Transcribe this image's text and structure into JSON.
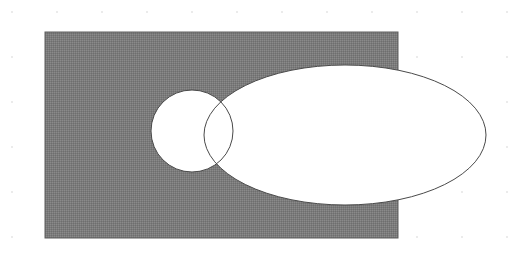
{
  "figure": {
    "title": "Overlapping shapes diagram",
    "canvas": {
      "width": 510,
      "height": 270,
      "background_color": "#ffffff"
    },
    "background_grid": {
      "name": "dot-grid",
      "visible": true,
      "spacing_x": 45,
      "spacing_y": 45,
      "offset_x": 12,
      "offset_y": 12,
      "dot_radius": 0.9,
      "color": "#e2e2e2"
    },
    "shapes": [
      {
        "id": "rectangle",
        "label": "Gray rectangle",
        "type": "rect",
        "x": 45,
        "y": 32,
        "width": 353,
        "height": 206,
        "fill_color": "#7b7b7b",
        "stroke_color": "#5f5f5f",
        "stroke_width": 1,
        "texture": "dithered"
      },
      {
        "id": "circle",
        "label": "Small white circle",
        "type": "circle",
        "cx": 192,
        "cy": 131,
        "r": 41,
        "fill_color": "#ffffff",
        "stroke_color": "#4a4a4a",
        "stroke_width": 1
      },
      {
        "id": "ellipse",
        "label": "Large white ellipse",
        "type": "ellipse",
        "cx": 345,
        "cy": 135,
        "rx": 141,
        "ry": 70,
        "fill_color": "#ffffff",
        "stroke_color": "#4a4a4a",
        "stroke_width": 1
      }
    ],
    "notes": {
      "overlap": "circle and ellipse intersect forming a lens region",
      "knockout": "white shapes are drawn over the gray rectangle"
    }
  }
}
